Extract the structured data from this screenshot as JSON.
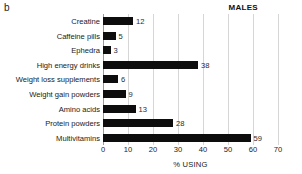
{
  "figure": {
    "panel_label": "b",
    "group_title": "MALES"
  },
  "chart_data": {
    "type": "bar",
    "orientation": "horizontal",
    "title": "MALES",
    "panel": "b",
    "xlabel": "% USING",
    "ylabel": "",
    "xlim": [
      0,
      70
    ],
    "xticks": [
      0,
      10,
      20,
      30,
      40,
      50,
      60,
      70
    ],
    "grid": "vertical",
    "legend": "none",
    "bar_color": "#0d0d0d",
    "gridline_color": "#d6d6d6",
    "value_labels": true,
    "categories": [
      "Creatine",
      "Caffeine pills",
      "Ephedra",
      "High energy drinks",
      "Weight loss supplements",
      "Weight gain powders",
      "Amino acids",
      "Protein powders",
      "Multivitamins"
    ],
    "values": [
      12,
      5,
      3,
      38,
      6,
      9,
      13,
      28,
      59
    ],
    "labels": [
      "12",
      "5",
      "3",
      "38",
      "6",
      "9",
      "13",
      "28",
      "59"
    ],
    "xtick_labels": [
      "0",
      "10",
      "20",
      "30",
      "40",
      "50",
      "60",
      "70"
    ]
  }
}
